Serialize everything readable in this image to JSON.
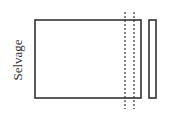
{
  "diagram": {
    "type": "fabric-cutting-diagram",
    "label": "Selvage",
    "colors": {
      "stroke": "#333333",
      "background": "#ffffff"
    },
    "main_panel": {
      "x": 35,
      "y": 20,
      "width": 106,
      "height": 78
    },
    "cut_lines": [
      {
        "x": 125,
        "y1": 12,
        "y2": 109,
        "style": "dashed"
      },
      {
        "x": 134,
        "y1": 12,
        "y2": 109,
        "style": "dashed"
      }
    ],
    "cut_strip": {
      "x": 149,
      "y": 20,
      "width": 7,
      "height": 78
    }
  }
}
